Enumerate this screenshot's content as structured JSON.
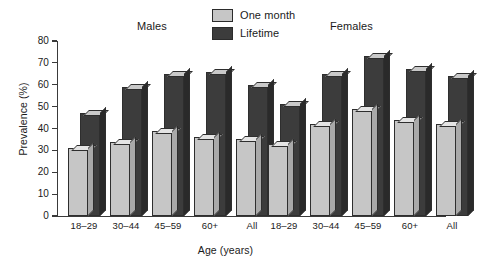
{
  "chart_data": {
    "type": "bar",
    "title": "",
    "xlabel": "Age (years)",
    "ylabel": "Prevalence (%)",
    "ylim": [
      0,
      80
    ],
    "yticks": [
      0,
      10,
      20,
      30,
      40,
      50,
      60,
      70,
      80
    ],
    "grid": false,
    "legend_position": "top-center",
    "panels": [
      {
        "name": "Males",
        "categories": [
          "18–29",
          "30–44",
          "45–59",
          "60+",
          "All"
        ],
        "series": [
          {
            "name": "One month",
            "values": [
              31,
              34,
              39,
              36,
              35
            ]
          },
          {
            "name": "Lifetime",
            "values": [
              47,
              59,
              65,
              66,
              60
            ]
          }
        ]
      },
      {
        "name": "Females",
        "categories": [
          "18–29",
          "30–44",
          "45–59",
          "60+",
          "All"
        ],
        "series": [
          {
            "name": "One month",
            "values": [
              33,
              42,
              49,
              44,
              42
            ]
          },
          {
            "name": "Lifetime",
            "values": [
              51,
              65,
              73,
              67,
              64
            ]
          }
        ]
      }
    ],
    "series_colors": {
      "One month": "#c6c6c6",
      "Lifetime": "#3c3c3c"
    }
  },
  "legend": {
    "items": [
      {
        "label": "One month",
        "color": "#c6c6c6"
      },
      {
        "label": "Lifetime",
        "color": "#3c3c3c"
      }
    ]
  },
  "axes": {
    "y_title": "Prevalence (%)",
    "x_title": "Age (years)",
    "y_tick_labels": [
      "80",
      "70",
      "60",
      "50",
      "40",
      "30",
      "20",
      "10",
      "0"
    ]
  },
  "panel_titles": {
    "males": "Males",
    "females": "Females"
  },
  "x_tick_labels": [
    "18–29",
    "30–44",
    "45–59",
    "60+",
    "All",
    "18–29",
    "30–44",
    "45–59",
    "60+",
    "All"
  ]
}
